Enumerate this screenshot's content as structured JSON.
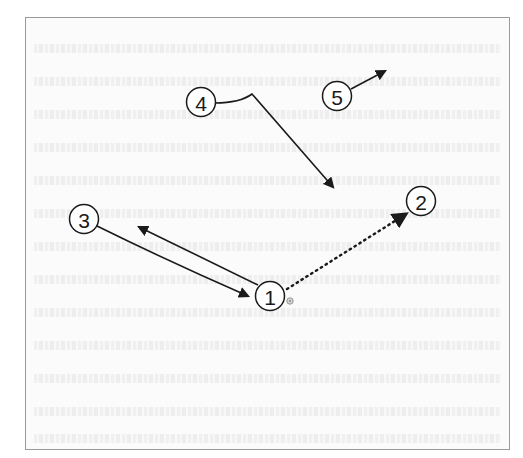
{
  "diagram": {
    "colors": {
      "stroke": "#1a1a1a",
      "frame_border": "#9a9a9a",
      "background": "#fbfbfb",
      "marker": "#8a8a8a"
    },
    "callouts": [
      {
        "id": "1",
        "label": "1",
        "cx": 270,
        "cy": 296
      },
      {
        "id": "2",
        "label": "2",
        "cx": 421,
        "cy": 201
      },
      {
        "id": "3",
        "label": "3",
        "cx": 84,
        "cy": 219
      },
      {
        "id": "4",
        "label": "4",
        "cx": 201,
        "cy": 102
      },
      {
        "id": "5",
        "label": "5",
        "cx": 337,
        "cy": 96
      }
    ],
    "arrows": [
      {
        "from": "3",
        "to": "1",
        "style": "solid",
        "description": "from callout 3 toward callout 1"
      },
      {
        "from": "1",
        "to": "upper-left",
        "style": "solid",
        "description": "from callout 1 pointing up-left"
      },
      {
        "from": "1",
        "to": "2",
        "style": "dotted",
        "description": "from callout 1 to callout 2"
      },
      {
        "from": "4",
        "to": "lower-right",
        "style": "solid",
        "description": "hooked line from callout 4 pointing down-right"
      },
      {
        "from": "5",
        "to": "upper-right",
        "style": "solid",
        "description": "short arrow from callout 5 pointing up-right"
      }
    ],
    "marker": {
      "name": "target-marker",
      "cx": 290,
      "cy": 301
    }
  }
}
